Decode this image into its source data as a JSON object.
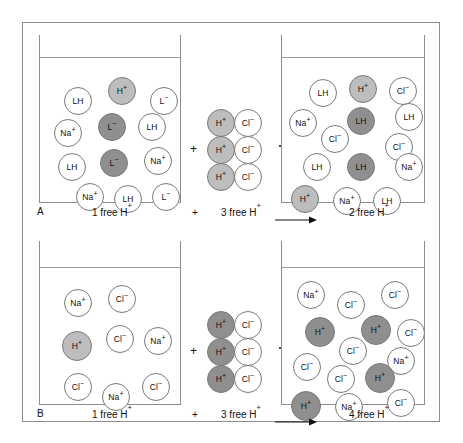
{
  "figure": {
    "width": 463,
    "height": 443,
    "colors": {
      "frame": "#8d8d8d",
      "outline": "#7a7a7a",
      "white_fill": "#ffffff",
      "light_gray_fill": "#bdbdbd",
      "dark_gray_fill": "#8f8f8f",
      "text": "#111111",
      "background": "#ffffff"
    },
    "operators": {
      "plus": "+",
      "arrow": "arrow-right"
    }
  },
  "chart_data": {
    "type": "diagram",
    "panels": [
      {
        "id": "A",
        "letter": "A",
        "caption": {
          "left": "1 free H",
          "left_sup": "+",
          "plus": "+",
          "middle": "3 free H",
          "middle_sup": "+",
          "arrow": "⟶",
          "right": "2 free H",
          "right_sup": "+"
        },
        "left_beaker": {
          "name": "beaker-a-before",
          "free_h_count": 1,
          "species": [
            {
              "label": "LH",
              "sup": "",
              "fill": "white",
              "x": 18,
              "y": 22,
              "r": 14
            },
            {
              "label": "H",
              "sup": "+",
              "fill": "light",
              "x": 62,
              "y": 12,
              "r": 14
            },
            {
              "label": "L",
              "sup": "−",
              "fill": "white",
              "x": 104,
              "y": 22,
              "r": 14
            },
            {
              "label": "Na",
              "sup": "+",
              "fill": "white",
              "x": 8,
              "y": 54,
              "r": 14
            },
            {
              "label": "L",
              "sup": "−",
              "fill": "dark",
              "x": 52,
              "y": 48,
              "r": 14
            },
            {
              "label": "LH",
              "sup": "",
              "fill": "white",
              "x": 92,
              "y": 48,
              "r": 14
            },
            {
              "label": "LH",
              "sup": "",
              "fill": "white",
              "x": 12,
              "y": 88,
              "r": 14
            },
            {
              "label": "L",
              "sup": "−",
              "fill": "dark",
              "x": 54,
              "y": 84,
              "r": 14
            },
            {
              "label": "Na",
              "sup": "+",
              "fill": "white",
              "x": 98,
              "y": 82,
              "r": 14
            },
            {
              "label": "Na",
              "sup": "+",
              "fill": "white",
              "x": 30,
              "y": 118,
              "r": 14
            },
            {
              "label": "LH",
              "sup": "",
              "fill": "white",
              "x": 68,
              "y": 120,
              "r": 14
            },
            {
              "label": "L",
              "sup": "−",
              "fill": "white",
              "x": 106,
              "y": 118,
              "r": 14
            }
          ]
        },
        "middle_group": {
          "name": "acid-added-a",
          "pairs": [
            {
              "cation": "H",
              "cation_sup": "+",
              "anion": "Cl",
              "anion_sup": "−"
            },
            {
              "cation": "H",
              "cation_sup": "+",
              "anion": "Cl",
              "anion_sup": "−"
            },
            {
              "cation": "H",
              "cation_sup": "+",
              "anion": "Cl",
              "anion_sup": "−"
            }
          ]
        },
        "right_beaker": {
          "name": "beaker-a-after",
          "free_h_count": 2,
          "species": [
            {
              "label": "LH",
              "sup": "",
              "fill": "white",
              "x": 22,
              "y": 16,
              "r": 14
            },
            {
              "label": "H",
              "sup": "+",
              "fill": "light",
              "x": 62,
              "y": 12,
              "r": 14
            },
            {
              "label": "Cl",
              "sup": "−",
              "fill": "white",
              "x": 102,
              "y": 14,
              "r": 14
            },
            {
              "label": "Na",
              "sup": "+",
              "fill": "white",
              "x": 2,
              "y": 46,
              "r": 14
            },
            {
              "label": "LH",
              "sup": "",
              "fill": "dark",
              "x": 60,
              "y": 44,
              "r": 14
            },
            {
              "label": "LH",
              "sup": "",
              "fill": "white",
              "x": 108,
              "y": 40,
              "r": 14
            },
            {
              "label": "Cl",
              "sup": "−",
              "fill": "white",
              "x": 34,
              "y": 62,
              "r": 14
            },
            {
              "label": "Cl",
              "sup": "−",
              "fill": "white",
              "x": 98,
              "y": 70,
              "r": 14
            },
            {
              "label": "LH",
              "sup": "",
              "fill": "white",
              "x": 16,
              "y": 90,
              "r": 14
            },
            {
              "label": "LH",
              "sup": "",
              "fill": "dark",
              "x": 60,
              "y": 90,
              "r": 14
            },
            {
              "label": "Na",
              "sup": "+",
              "fill": "white",
              "x": 108,
              "y": 90,
              "r": 14
            },
            {
              "label": "H",
              "sup": "+",
              "fill": "light",
              "x": 4,
              "y": 122,
              "r": 14
            },
            {
              "label": "Na",
              "sup": "+",
              "fill": "white",
              "x": 46,
              "y": 124,
              "r": 14
            },
            {
              "label": "LH",
              "sup": "",
              "fill": "white",
              "x": 86,
              "y": 124,
              "r": 14
            }
          ]
        }
      },
      {
        "id": "B",
        "letter": "B",
        "caption": {
          "left": "1 free H",
          "left_sup": "+",
          "plus": "+",
          "middle": "3 free H",
          "middle_sup": "+",
          "arrow": "⟶",
          "right": "4 free H",
          "right_sup": "+"
        },
        "left_beaker": {
          "name": "beaker-b-before",
          "free_h_count": 1,
          "species": [
            {
              "label": "Na",
              "sup": "+",
              "fill": "white",
              "x": 18,
              "y": 16,
              "r": 14
            },
            {
              "label": "Cl",
              "sup": "−",
              "fill": "white",
              "x": 62,
              "y": 12,
              "r": 14
            },
            {
              "label": "H",
              "sup": "+",
              "fill": "light",
              "x": 16,
              "y": 58,
              "r": 15
            },
            {
              "label": "Cl",
              "sup": "−",
              "fill": "white",
              "x": 60,
              "y": 52,
              "r": 14
            },
            {
              "label": "Na",
              "sup": "+",
              "fill": "white",
              "x": 98,
              "y": 54,
              "r": 14
            },
            {
              "label": "Cl",
              "sup": "−",
              "fill": "white",
              "x": 18,
              "y": 100,
              "r": 14
            },
            {
              "label": "Na",
              "sup": "+",
              "fill": "white",
              "x": 56,
              "y": 110,
              "r": 14
            },
            {
              "label": "Cl",
              "sup": "−",
              "fill": "white",
              "x": 96,
              "y": 100,
              "r": 14
            }
          ]
        },
        "middle_group": {
          "name": "acid-added-b",
          "pairs": [
            {
              "cation": "H",
              "cation_sup": "+",
              "anion": "Cl",
              "anion_sup": "−"
            },
            {
              "cation": "H",
              "cation_sup": "+",
              "anion": "Cl",
              "anion_sup": "−"
            },
            {
              "cation": "H",
              "cation_sup": "+",
              "anion": "Cl",
              "anion_sup": "−"
            }
          ]
        },
        "right_beaker": {
          "name": "beaker-b-after",
          "free_h_count": 4,
          "species": [
            {
              "label": "Na",
              "sup": "+",
              "fill": "white",
              "x": 10,
              "y": 8,
              "r": 14
            },
            {
              "label": "Cl",
              "sup": "−",
              "fill": "white",
              "x": 50,
              "y": 18,
              "r": 14
            },
            {
              "label": "Cl",
              "sup": "−",
              "fill": "white",
              "x": 94,
              "y": 8,
              "r": 14
            },
            {
              "label": "H",
              "sup": "+",
              "fill": "dark",
              "x": 18,
              "y": 44,
              "r": 15
            },
            {
              "label": "H",
              "sup": "+",
              "fill": "dark",
              "x": 74,
              "y": 42,
              "r": 15
            },
            {
              "label": "Cl",
              "sup": "−",
              "fill": "white",
              "x": 110,
              "y": 46,
              "r": 14
            },
            {
              "label": "Cl",
              "sup": "−",
              "fill": "white",
              "x": 52,
              "y": 64,
              "r": 14
            },
            {
              "label": "Cl",
              "sup": "−",
              "fill": "white",
              "x": 6,
              "y": 80,
              "r": 14
            },
            {
              "label": "Na",
              "sup": "+",
              "fill": "white",
              "x": 100,
              "y": 74,
              "r": 14
            },
            {
              "label": "Cl",
              "sup": "−",
              "fill": "white",
              "x": 40,
              "y": 92,
              "r": 14
            },
            {
              "label": "H",
              "sup": "+",
              "fill": "dark",
              "x": 78,
              "y": 90,
              "r": 15
            },
            {
              "label": "H",
              "sup": "+",
              "fill": "dark",
              "x": 4,
              "y": 118,
              "r": 15
            },
            {
              "label": "Na",
              "sup": "+",
              "fill": "white",
              "x": 48,
              "y": 120,
              "r": 14
            },
            {
              "label": "Cl",
              "sup": "−",
              "fill": "white",
              "x": 100,
              "y": 116,
              "r": 14
            }
          ]
        }
      }
    ]
  }
}
